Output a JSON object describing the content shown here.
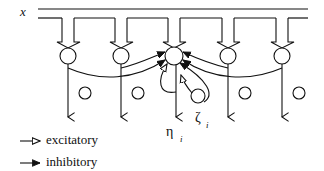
{
  "diagram": {
    "input_label": "x",
    "output_label": "η",
    "output_subscript": "i",
    "self_loop_label": "ζ",
    "self_loop_subscript": "i",
    "neurons": 5,
    "center_neuron_index": 2
  },
  "legend": {
    "items": [
      {
        "marker": "open-arrow",
        "label": "excitatory"
      },
      {
        "marker": "filled-arrow",
        "label": "inhibitory"
      }
    ]
  },
  "colors": {
    "stroke": "#111111",
    "background": "#ffffff"
  }
}
